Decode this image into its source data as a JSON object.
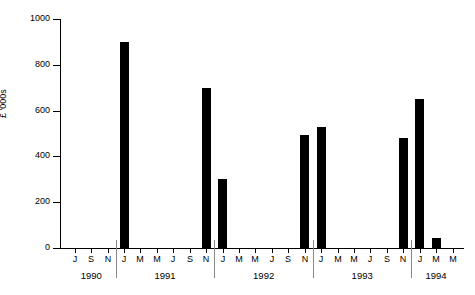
{
  "chart_data": {
    "type": "bar",
    "title": "",
    "xlabel": "",
    "ylabel": "£ '000s",
    "ylim": [
      0,
      1000
    ],
    "ytick_values": [
      0,
      200,
      400,
      600,
      800,
      1000
    ],
    "ytick_labels": [
      "0",
      "200",
      "400",
      "600",
      "800",
      "1000"
    ],
    "grid": false,
    "legend": "none",
    "x_tick_labels": [
      "J",
      "S",
      "N",
      "J",
      "M",
      "M",
      "J",
      "S",
      "N",
      "J",
      "M",
      "M",
      "J",
      "S",
      "N",
      "J",
      "M",
      "M",
      "J",
      "S",
      "N",
      "J",
      "M",
      "M"
    ],
    "year_groups": [
      {
        "label": "1990",
        "n_ticks": 3
      },
      {
        "label": "1991",
        "n_ticks": 6
      },
      {
        "label": "1992",
        "n_ticks": 6
      },
      {
        "label": "1993",
        "n_ticks": 6
      },
      {
        "label": "1994",
        "n_ticks": 3
      }
    ],
    "categories": [
      "Jul 1990",
      "Sep 1990",
      "Nov 1990",
      "Jan 1991",
      "Mar 1991",
      "May 1991",
      "Jul 1991",
      "Sep 1991",
      "Nov 1991",
      "Jan 1992",
      "Mar 1992",
      "May 1992",
      "Jul 1992",
      "Sep 1992",
      "Nov 1992",
      "Jan 1993",
      "Mar 1993",
      "May 1993",
      "Jul 1993",
      "Sep 1993",
      "Nov 1993",
      "Jan 1994",
      "Mar 1994",
      "May 1994"
    ],
    "values": [
      0,
      0,
      0,
      900,
      0,
      0,
      0,
      0,
      700,
      300,
      0,
      0,
      0,
      0,
      495,
      530,
      0,
      0,
      0,
      0,
      480,
      650,
      45,
      0
    ],
    "bars": [
      {
        "category": "Jan 1991",
        "value": 900
      },
      {
        "category": "Nov 1991",
        "value": 700
      },
      {
        "category": "Jan 1992",
        "value": 300
      },
      {
        "category": "Nov 1992",
        "value": 495
      },
      {
        "category": "Jan 1993",
        "value": 530
      },
      {
        "category": "Nov 1993",
        "value": 480
      },
      {
        "category": "Jan 1994",
        "value": 650
      },
      {
        "category": "Mar 1994",
        "value": 45
      }
    ],
    "colors": {
      "bar": "#000000",
      "axis": "#000000",
      "background": "#ffffff"
    }
  }
}
